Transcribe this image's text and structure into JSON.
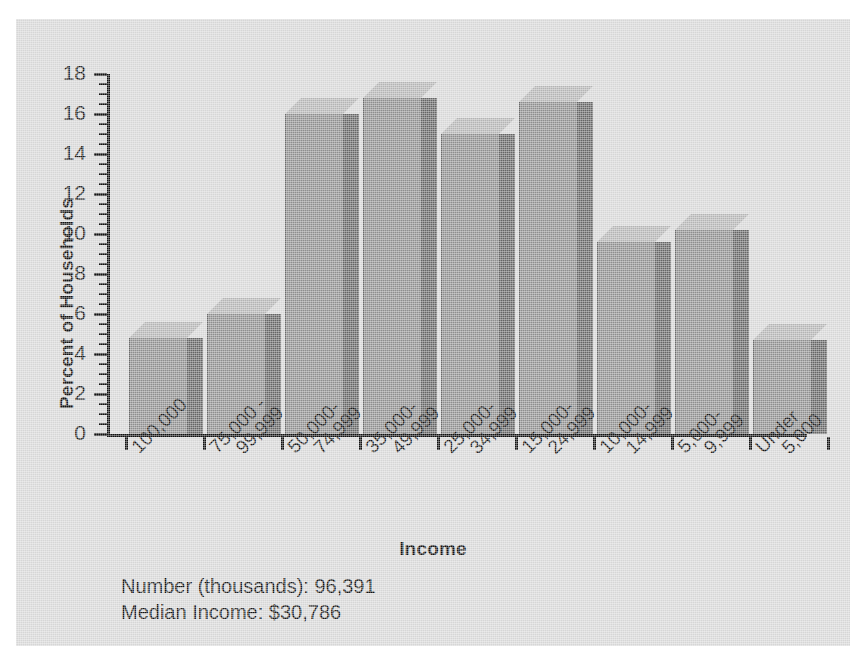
{
  "chart_data": {
    "type": "bar",
    "title": "",
    "xlabel": "Income",
    "ylabel": "Percent of Households",
    "ylim": [
      0,
      18
    ],
    "y_ticks": [
      0,
      2,
      4,
      6,
      8,
      10,
      12,
      14,
      16,
      18
    ],
    "y_minor_step": 0.5,
    "grid": false,
    "legend": null,
    "style": "3d-bar",
    "categories": [
      "100,000",
      "75,000 -\n99,999",
      "50,000-\n74,999",
      "35,000-\n49,999",
      "25,000-\n34,999",
      "15,000-\n24,999",
      "10,000-\n14,999",
      "5,000-\n9,999",
      "Under\n5,000"
    ],
    "values": [
      4.8,
      6.0,
      16.0,
      16.8,
      15.0,
      16.6,
      9.6,
      10.2,
      4.7
    ],
    "annotations": [
      "Number (thousands): 96,391",
      "Median Income: $30,786"
    ]
  },
  "axes": {
    "y_title": "Percent of Households",
    "x_title": "Income",
    "y_tick_labels": [
      "0",
      "2",
      "4",
      "6",
      "8",
      "10",
      "12",
      "14",
      "16",
      "18"
    ]
  },
  "category_labels": [
    {
      "line1": "100,000",
      "line2": ""
    },
    {
      "line1": "75,000 -",
      "line2": "99,999"
    },
    {
      "line1": "50,000-",
      "line2": "74,999"
    },
    {
      "line1": "35,000-",
      "line2": "49,999"
    },
    {
      "line1": "25,000-",
      "line2": "34,999"
    },
    {
      "line1": "15,000-",
      "line2": "24,999"
    },
    {
      "line1": "10,000-",
      "line2": "14,999"
    },
    {
      "line1": "5,000-",
      "line2": "9,999"
    },
    {
      "line1": "Under",
      "line2": "5,000"
    }
  ],
  "footnotes": {
    "line1": "Number (thousands): 96,391",
    "line2": "Median Income: $30,786"
  },
  "colors": {
    "panel_background": "#d6d6d6",
    "bar_front": "#8e8e8e",
    "bar_side": "#656565",
    "bar_top": "#b4b4b4",
    "axis": "#111111",
    "text": "#141414"
  }
}
